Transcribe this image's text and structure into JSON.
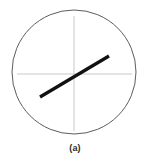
{
  "figure": {
    "caption": "(a)",
    "background_color": "#ffffff",
    "canvas": {
      "width": 150,
      "height": 160
    }
  },
  "chart_data": {
    "type": "scatter",
    "title": "",
    "subtitle": "",
    "xlabel": "",
    "ylabel": "",
    "annotation": "(a)",
    "grid": false,
    "legend": null,
    "axis_style": "crosshair",
    "xlim": [
      -1,
      1
    ],
    "ylim": [
      -1,
      1
    ],
    "elements": {
      "boundary_circle": {
        "name": "unit-circle",
        "center_x": 74,
        "center_y": 72,
        "radius": 62,
        "stroke_color": "#4a4a4a",
        "stroke_width": 0.9,
        "fill": "none"
      },
      "horizontal_axis": {
        "name": "x-axis",
        "x1": 17,
        "y1": 74,
        "x2": 132,
        "y2": 74,
        "stroke_color": "#c9c9c9",
        "stroke_width": 1
      },
      "vertical_axis": {
        "name": "y-axis",
        "x1": 74,
        "y1": 16,
        "x2": 74,
        "y2": 131,
        "stroke_color": "#c9c9c9",
        "stroke_width": 1
      },
      "data_line": {
        "name": "principal-axis-line",
        "x1": 40,
        "y1": 97,
        "x2": 109,
        "y2": 56,
        "stroke_color": "#111111",
        "stroke_width": 3.2,
        "slope": -0.594,
        "angle_degrees": 30.7,
        "length": 80.3
      }
    }
  }
}
